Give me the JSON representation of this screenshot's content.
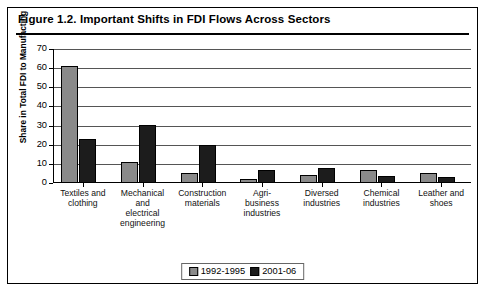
{
  "figure": {
    "title": "Figure 1.2.  Important Shifts in FDI Flows Across Sectors"
  },
  "legend": {
    "items": [
      {
        "label": "1992-1995",
        "color": "#8a8a8a"
      },
      {
        "label": "2001-06",
        "color": "#1c1c1c"
      }
    ]
  },
  "chart_data": {
    "type": "bar",
    "title": "Figure 1.2.  Important Shifts in FDI Flows Across Sectors",
    "xlabel": "",
    "ylabel": "Share in Total FDI to Manufacting",
    "ylim": [
      0,
      70
    ],
    "yticks": [
      0,
      10,
      20,
      30,
      40,
      50,
      60,
      70
    ],
    "ytick_labels": [
      "0",
      "10",
      "20",
      "30",
      "40",
      "50",
      "60",
      "70"
    ],
    "grid": true,
    "legend_position": "bottom-center",
    "categories": [
      "Textiles and clothing",
      "Mechanical and electrical engineering",
      "Construction materials",
      "Agri-business industries",
      "Diversed industries",
      "Chemical industries",
      "Leather and shoes"
    ],
    "category_lines": [
      [
        "Textiles and",
        "clothing"
      ],
      [
        "Mechanical",
        "and",
        "electrical",
        "engineering"
      ],
      [
        "Construction",
        "materials"
      ],
      [
        "Agri-",
        "business",
        "industries"
      ],
      [
        "Diversed",
        "industries"
      ],
      [
        "Chemical",
        "industries"
      ],
      [
        "Leather and",
        "shoes"
      ]
    ],
    "series": [
      {
        "name": "1992-1995",
        "color": "#8a8a8a",
        "values": [
          61,
          11,
          5,
          2,
          4,
          7,
          5
        ]
      },
      {
        "name": "2001-06",
        "color": "#1c1c1c",
        "values": [
          23,
          30.5,
          20,
          7,
          8,
          3.5,
          3
        ]
      }
    ]
  }
}
